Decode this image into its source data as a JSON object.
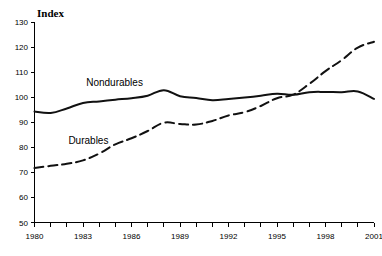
{
  "chart_data": {
    "type": "line",
    "title": "",
    "ylabel": "Index",
    "xlabel": "",
    "ylim": [
      50,
      130
    ],
    "xlim": [
      1980,
      2001
    ],
    "grid": false,
    "legend_position": "inline-annotation",
    "y_ticks": [
      130,
      120,
      110,
      100,
      90,
      80,
      70,
      60,
      50
    ],
    "x_ticks": [
      1980,
      1981,
      1982,
      1983,
      1984,
      1985,
      1986,
      1987,
      1988,
      1989,
      1990,
      1991,
      1992,
      1993,
      1994,
      1995,
      1996,
      1997,
      1998,
      1999,
      2000,
      2001
    ],
    "x_tick_labels": [
      "1980",
      "",
      "",
      "1983",
      "",
      "",
      "1986",
      "",
      "",
      "1989",
      "",
      "",
      "1992",
      "",
      "",
      "1995",
      "",
      "",
      "1998",
      "",
      "",
      "2001"
    ],
    "x": [
      1980,
      1981,
      1982,
      1983,
      1984,
      1985,
      1986,
      1987,
      1988,
      1989,
      1990,
      1991,
      1992,
      1993,
      1994,
      1995,
      1996,
      1997,
      1998,
      1999,
      2000,
      2001
    ],
    "series": [
      {
        "name": "Nondurables",
        "style": "solid",
        "color": "#111111",
        "label_x": 1983.2,
        "label_y": 104.5,
        "values": [
          94.3,
          93.7,
          95.5,
          97.7,
          98.3,
          99.0,
          99.6,
          100.6,
          102.8,
          100.4,
          99.7,
          98.8,
          99.3,
          99.9,
          100.6,
          101.4,
          101.0,
          102.0,
          102.1,
          102.0,
          102.3,
          99.3
        ]
      },
      {
        "name": "Durables",
        "style": "dashed",
        "color": "#111111",
        "label_x": 1982.1,
        "label_y": 81.5,
        "values": [
          71.7,
          72.6,
          73.4,
          74.8,
          77.5,
          81.2,
          83.6,
          86.5,
          89.8,
          89.3,
          89.1,
          90.5,
          92.7,
          94.0,
          96.5,
          99.6,
          101.0,
          105.3,
          110.4,
          114.8,
          119.8,
          122.1
        ]
      }
    ]
  },
  "axis": {
    "y_title": "Index"
  }
}
